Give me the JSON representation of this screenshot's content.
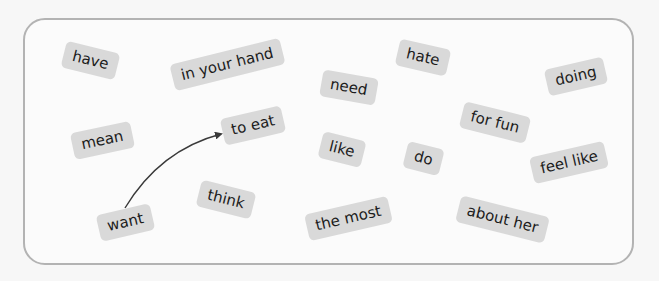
{
  "tiles": [
    {
      "id": "have",
      "label": "have",
      "cx": 90,
      "cy": 60,
      "rot": 14
    },
    {
      "id": "in-your-hand",
      "label": "in your hand",
      "cx": 227,
      "cy": 64,
      "rot": -14
    },
    {
      "id": "need",
      "label": "need",
      "cx": 349,
      "cy": 87,
      "rot": 10
    },
    {
      "id": "hate",
      "label": "hate",
      "cx": 423,
      "cy": 57,
      "rot": 13
    },
    {
      "id": "doing",
      "label": "doing",
      "cx": 576,
      "cy": 76,
      "rot": -13
    },
    {
      "id": "mean",
      "label": "mean",
      "cx": 102,
      "cy": 140,
      "rot": -12
    },
    {
      "id": "to-eat",
      "label": "to eat",
      "cx": 253,
      "cy": 125,
      "rot": -13
    },
    {
      "id": "like",
      "label": "like",
      "cx": 342,
      "cy": 149,
      "rot": 14
    },
    {
      "id": "do",
      "label": "do",
      "cx": 423,
      "cy": 158,
      "rot": 14
    },
    {
      "id": "for-fun",
      "label": "for fun",
      "cx": 495,
      "cy": 122,
      "rot": 14
    },
    {
      "id": "feel-like",
      "label": "feel like",
      "cx": 569,
      "cy": 162,
      "rot": -13
    },
    {
      "id": "want",
      "label": "want",
      "cx": 125,
      "cy": 222,
      "rot": -13
    },
    {
      "id": "think",
      "label": "think",
      "cx": 226,
      "cy": 199,
      "rot": 14
    },
    {
      "id": "the-most",
      "label": "the most",
      "cx": 348,
      "cy": 218,
      "rot": -13
    },
    {
      "id": "about-her",
      "label": "about her",
      "cx": 502,
      "cy": 219,
      "rot": 14
    }
  ],
  "arrow": {
    "from": "want",
    "to": "to-eat",
    "color": "#3a3a3a"
  },
  "colors": {
    "tile_bg": "#d9d9d9",
    "border": "#b3b3b3",
    "text": "#1c1c1c"
  }
}
